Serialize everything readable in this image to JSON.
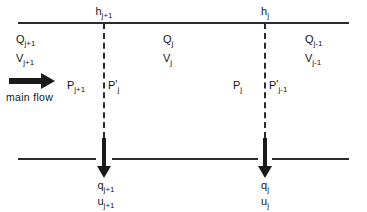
{
  "figure": {
    "type": "schematic-diagram",
    "colors": {
      "line": "#2b2b2b",
      "arrow": "#1a1a1a",
      "background": "#ffffff",
      "text": "#151515"
    }
  },
  "labels": {
    "node_head_left": {
      "base": "h",
      "sub": "j+1",
      "full": "h j+1"
    },
    "node_head_right": {
      "base": "h",
      "sub": "j",
      "full": "h j"
    },
    "segment_left_flow": {
      "base": "Q",
      "sub": "j+1",
      "full": "Q j+1"
    },
    "segment_left_velocity": {
      "base": "V",
      "sub": "j+1",
      "full": "V j+1"
    },
    "segment_mid_flow": {
      "base": "Q",
      "sub": "j",
      "full": "Q j"
    },
    "segment_mid_velocity": {
      "base": "V",
      "sub": "j",
      "full": "V j"
    },
    "segment_right_flow": {
      "base": "Q",
      "sub": "j-1",
      "full": "Q j-1"
    },
    "segment_right_velocity": {
      "base": "V",
      "sub": "j-1",
      "full": "V j-1"
    },
    "pressure_left_upstream": {
      "base": "P",
      "prime": "",
      "sub": "j+1",
      "full": "P j+1"
    },
    "pressure_left_downstream": {
      "base": "P",
      "prime": "'",
      "sub": "j",
      "full": "P' j"
    },
    "pressure_right_upstream": {
      "base": "P",
      "prime": "",
      "sub": "j",
      "full": "P j"
    },
    "pressure_right_downstream": {
      "base": "P",
      "prime": "'",
      "sub": "j-1",
      "full": "P' j-1"
    },
    "offtake_left_discharge": {
      "base": "q",
      "sub": "j+1",
      "full": "q j+1"
    },
    "offtake_left_velocity": {
      "base": "u",
      "sub": "j+1",
      "full": "u j+1"
    },
    "offtake_right_discharge": {
      "base": "q",
      "sub": "j",
      "full": "q j"
    },
    "offtake_right_velocity": {
      "base": "u",
      "sub": "j",
      "full": "u j"
    },
    "main_flow": "main  flow"
  },
  "icons": {
    "main_flow_arrow": "right-arrow-icon",
    "offtake_arrow_left": "down-arrow-icon",
    "offtake_arrow_right": "down-arrow-icon"
  }
}
